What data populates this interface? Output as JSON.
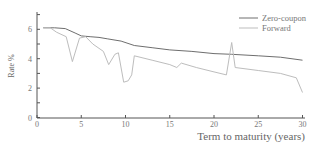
{
  "chart_data": {
    "type": "line",
    "title": "",
    "xlabel": "Term to maturity (years)",
    "ylabel": "Rate %",
    "xlim": [
      0,
      30
    ],
    "ylim": [
      0,
      7
    ],
    "xticks": [
      0,
      5,
      10,
      15,
      20,
      25,
      30
    ],
    "yticks": [
      0,
      2,
      4,
      6
    ],
    "grid": false,
    "legend_position": "top-right",
    "series": [
      {
        "name": "Zero-coupon",
        "color": "#6e6e6e",
        "x": [
          0.7,
          2.0,
          3.2,
          4.3,
          5.0,
          6.0,
          7.0,
          8.0,
          9.5,
          11.0,
          13.0,
          15.0,
          17.5,
          20.0,
          22.0,
          25.0,
          27.5,
          30.0
        ],
        "y": [
          6.1,
          6.1,
          6.05,
          5.75,
          5.55,
          5.5,
          5.45,
          5.35,
          5.2,
          4.9,
          4.75,
          4.6,
          4.5,
          4.35,
          4.3,
          4.2,
          4.1,
          3.9
        ]
      },
      {
        "name": "Forward",
        "color": "#bdbdbd",
        "x": [
          0.7,
          1.5,
          2.2,
          3.3,
          4.0,
          4.8,
          5.5,
          6.3,
          7.5,
          8.1,
          8.8,
          9.2,
          9.8,
          10.3,
          10.7,
          11.0,
          13.0,
          15.0,
          15.8,
          16.3,
          18.0,
          20.0,
          21.4,
          22.0,
          22.4,
          25.0,
          27.5,
          29.3,
          30.0
        ],
        "y": [
          6.1,
          6.1,
          5.8,
          5.5,
          3.8,
          5.4,
          5.5,
          5.0,
          4.5,
          3.6,
          4.3,
          4.4,
          2.4,
          2.5,
          2.9,
          4.2,
          3.9,
          3.6,
          3.4,
          3.7,
          3.4,
          3.1,
          2.9,
          5.1,
          3.4,
          3.2,
          3.0,
          2.7,
          1.7
        ]
      }
    ]
  },
  "legend": {
    "items": [
      {
        "label": "Zero-coupon",
        "color": "#6e6e6e"
      },
      {
        "label": "Forward",
        "color": "#bdbdbd"
      }
    ]
  },
  "axes": {
    "x_title": "Term to maturity (years)",
    "y_title": "Rate %",
    "x_tick_labels": [
      "0",
      "5",
      "10",
      "15",
      "20",
      "25",
      "30"
    ],
    "y_tick_labels": [
      "0",
      "2",
      "4",
      "6"
    ]
  }
}
